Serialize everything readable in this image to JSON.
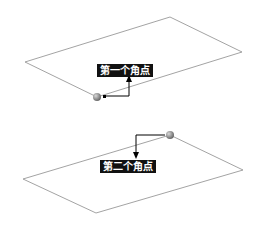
{
  "diagram": {
    "planes": [
      {
        "name": "top-plane",
        "points": "25,62 170,17 242,52 97,97"
      },
      {
        "name": "bottom-plane",
        "points": "23,179 170,135 243,170 96,213"
      }
    ],
    "callouts": [
      {
        "label": "第一个角点",
        "corner": [
          97,
          97
        ]
      },
      {
        "label": "第二个角点",
        "corner": [
          170,
          135
        ]
      }
    ],
    "colors": {
      "outline": "#999999",
      "label_bg": "#111111",
      "sphere": "#8a8a8a"
    }
  }
}
